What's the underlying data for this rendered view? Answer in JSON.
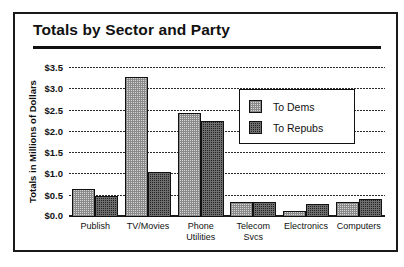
{
  "chart_data": {
    "type": "bar",
    "title": "Totals by Sector and Party",
    "xlabel": "",
    "ylabel": "Totals in Millions of Dollars",
    "ylim": [
      0.0,
      3.5
    ],
    "ytick_labels": [
      "$3.5",
      "$3.0",
      "$2.5",
      "$2.0",
      "$1.5",
      "$1.0",
      "$0.5",
      "$0.0"
    ],
    "ytick_values": [
      3.5,
      3.0,
      2.5,
      2.0,
      1.5,
      1.0,
      0.5,
      0.0
    ],
    "grid": true,
    "legend_position": "upper right",
    "categories": [
      "Publish",
      "TV/Movies",
      "Phone Utilities",
      "Telecom Svcs",
      "Electronics",
      "Computers"
    ],
    "category_lines": [
      [
        "Publish",
        ""
      ],
      [
        "TV/Movies",
        ""
      ],
      [
        "Phone",
        "Utilities"
      ],
      [
        "Telecom",
        "Svcs"
      ],
      [
        "Electronics",
        ""
      ],
      [
        "Computers",
        ""
      ]
    ],
    "series": [
      {
        "name": "To Dems",
        "key": "dems",
        "values": [
          0.65,
          3.3,
          2.45,
          0.35,
          0.15,
          0.35
        ]
      },
      {
        "name": "To Repubs",
        "key": "repubs",
        "values": [
          0.5,
          1.05,
          2.25,
          0.35,
          0.3,
          0.42
        ]
      }
    ]
  },
  "legend": {
    "entries": [
      {
        "label": "To Dems",
        "key": "dems"
      },
      {
        "label": "To Repubs",
        "key": "repubs"
      }
    ]
  },
  "colors": {
    "dems_fill": "#d8d8d8",
    "repubs_fill": "#1f1f1f",
    "outline": "#111111",
    "frame": "#1a1a1a"
  }
}
